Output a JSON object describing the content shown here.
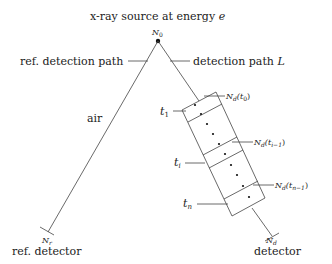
{
  "title": "x-ray source at energy ",
  "title_var": "e",
  "source_label": "N",
  "source_sub": "0",
  "ref_path_label": "ref. detection path",
  "det_path_label": "detection path ",
  "det_path_var": "L",
  "medium_label": "air",
  "layers": {
    "t1": {
      "var": "t",
      "sub": "1"
    },
    "ti": {
      "var": "t",
      "sub": "i"
    },
    "tn": {
      "var": "t",
      "sub": "n"
    }
  },
  "counts": {
    "nd_t0": {
      "main": "N",
      "sub": "d",
      "arg": "(t",
      "arg_sub": "0",
      "close": ")"
    },
    "nd_ti1": {
      "main": "N",
      "sub": "d",
      "arg": "(t",
      "arg_sub": "i−1",
      "close": ")"
    },
    "nd_tn1": {
      "main": "N",
      "sub": "d",
      "arg": "(t",
      "arg_sub": "n−1",
      "close": ")"
    }
  },
  "ref_detector": {
    "count_main": "N",
    "count_sub": "r",
    "label": "ref. detector"
  },
  "detector": {
    "count_main": "N",
    "count_sub": "d",
    "label": "detector"
  }
}
